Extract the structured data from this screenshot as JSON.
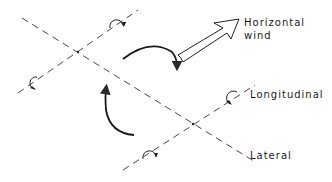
{
  "diagram": {
    "type": "axes-rotation-diagram",
    "colors": {
      "line": "#2a2a2a",
      "background": "#ffffff"
    },
    "axes": [
      {
        "name": "lateral",
        "style": "dashed"
      },
      {
        "name": "longitudinal-upper",
        "style": "dashed"
      },
      {
        "name": "longitudinal-lower",
        "style": "dashed"
      }
    ],
    "rotation_symbols": 4,
    "curved_arrows": 2,
    "wind_arrow": "hollow-arrow"
  },
  "labels": {
    "horizontal_wind_line1": "Horizontal",
    "horizontal_wind_line2": "wind",
    "longitudinal": "Longitudinal",
    "lateral": "Lateral"
  }
}
